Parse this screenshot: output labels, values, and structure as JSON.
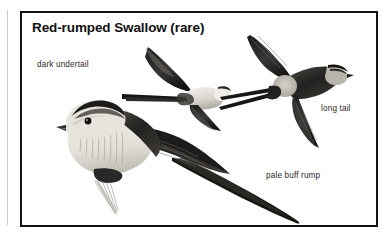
{
  "plate": {
    "title": "Red-rumped Swallow (rare)",
    "border_color": "#15130f",
    "background_color": "#ffffff"
  },
  "callouts": [
    {
      "id": "dark-undertail",
      "text": "dark undertail",
      "x": 35,
      "y": 58
    },
    {
      "id": "long-tail",
      "text": "long tail",
      "x": 319,
      "y": 102
    },
    {
      "id": "pale-buff-rump",
      "text": "pale buff rump",
      "x": 264,
      "y": 169
    }
  ],
  "figures": [
    {
      "id": "flying-swallow-underside",
      "name": "flying swallow, underside view",
      "description": "swallow in flight seen from below, pale throat and belly, dark undertail coverts, swept-back pointed wings, narrow forked tail trailing left"
    },
    {
      "id": "flying-swallow-upperside",
      "name": "flying swallow, upperside view",
      "description": "swallow in flight seen from above, glossy dark blue-black upperparts, pale buff rump patch, rufous nape collar, deeply forked long tail streamers"
    },
    {
      "id": "perched-swallow",
      "name": "perched swallow, side view",
      "description": "swallow perched facing left, streaked buff underparts, dark cap and mantle, long folded wings and very long outer tail streamer extending to lower right"
    }
  ],
  "palette": {
    "ink": "#15130f",
    "dark_plumage": "#2f2d2b",
    "mid_gray": "#6e6b67",
    "pale_buff": "#c9c5bd",
    "paper": "#ffffff",
    "page_rule": "#c9c9c9",
    "label_text": "#2b2a28"
  }
}
